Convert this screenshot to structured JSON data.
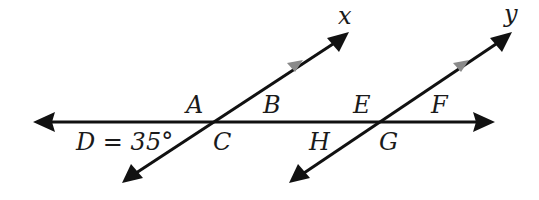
{
  "diagram": {
    "type": "parallel lines cut by a transversal",
    "colors": {
      "line": "#111111",
      "mid_arrow": "#8a8a8a",
      "text": "#1a1a1a",
      "background": "#ffffff"
    },
    "lines": {
      "x": {
        "label": "x"
      },
      "y": {
        "label": "y"
      },
      "transversal": {
        "label": ""
      }
    },
    "angle_labels": {
      "A": "A",
      "B": "B",
      "C": "C",
      "D": "D = 35°",
      "E": "E",
      "F": "F",
      "G": "G",
      "H": "H"
    }
  }
}
